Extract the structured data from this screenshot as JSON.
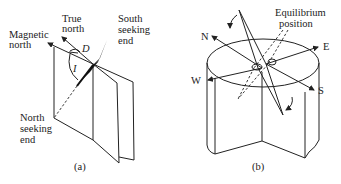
{
  "figure_a": {
    "caption": "(a)",
    "labels": {
      "magnetic_north_1": "Magnetic",
      "magnetic_north_2": "north",
      "true_north_1": "True",
      "true_north_2": "north",
      "south_seeking_1": "South",
      "south_seeking_2": "seeking",
      "south_seeking_3": "end",
      "north_seeking_1": "North",
      "north_seeking_2": "seeking",
      "north_seeking_3": "end",
      "declination": "D",
      "inclination": "I"
    }
  },
  "figure_b": {
    "caption": "(b)",
    "labels": {
      "equilibrium_1": "Equilibrium",
      "equilibrium_2": "position",
      "north": "N",
      "east": "E",
      "west": "W",
      "south": "S"
    }
  },
  "colors": {
    "ink": "#222222",
    "background": "#ffffff"
  }
}
